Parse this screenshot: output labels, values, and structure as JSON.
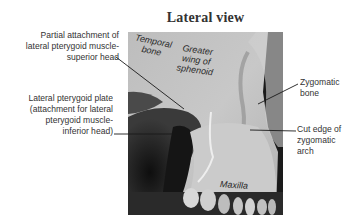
{
  "figure": {
    "title": "Lateral view",
    "photo_labels": {
      "temporal_bone": [
        "Temporal",
        "bone"
      ],
      "greater_wing": [
        "Greater",
        "wing of",
        "sphenoid"
      ],
      "maxilla": "Maxilla"
    },
    "callouts": {
      "superior_head": [
        "Partial attachment of",
        "lateral pterygoid muscle-",
        "superior head"
      ],
      "pterygoid_plate": [
        "Lateral pterygoid plate",
        "(attachment for lateral",
        "pterygoid muscle-",
        "inferior head)"
      ],
      "zygomatic_bone": [
        "Zygomatic",
        "bone"
      ],
      "cut_edge": [
        "Cut edge of",
        "zygomatic",
        "arch"
      ]
    },
    "colors": {
      "text": "#333333",
      "leader_line": "#1a1a1a",
      "bone_light": "#c9c9c9",
      "bone_mid": "#a8a8a8",
      "shadow": "#1c1c1c"
    }
  }
}
